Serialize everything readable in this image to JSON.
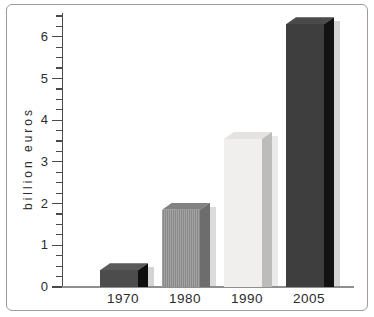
{
  "chart_data": {
    "type": "bar",
    "title": "",
    "xlabel": "",
    "ylabel": "billion euros",
    "categories": [
      "1970",
      "1980",
      "1990",
      "2005"
    ],
    "values": [
      0.4,
      1.85,
      3.55,
      6.3
    ],
    "ylim": [
      0,
      6.5
    ],
    "yticks": [
      "0",
      "1",
      "2",
      "3",
      "4",
      "5",
      "6"
    ],
    "minor_tick_step": 0.25,
    "grid": false,
    "legend": "none",
    "bar_style": "3d",
    "bars": [
      {
        "label": "1970",
        "value": 0.4,
        "front": "#4c4c4c",
        "top": "#5a5a5a",
        "side": "#0f0f0f",
        "shadow": "#d4d4d4",
        "texture": "solid"
      },
      {
        "label": "1980",
        "value": 1.85,
        "front": "#a3a3a3",
        "stripe": "#898989",
        "top": "#828282",
        "side": "#6d6d6d",
        "shadow": "#dcdcdc",
        "texture": "pinstripe"
      },
      {
        "label": "1990",
        "value": 3.55,
        "front": "#f0efed",
        "top": "#e4e3e1",
        "side": "#bcbcba",
        "shadow": "#eaeaea",
        "texture": "solid"
      },
      {
        "label": "2005",
        "value": 6.3,
        "front": "#3e3e3e",
        "top": "#4a4a4a",
        "side": "#121212",
        "shadow": "#d4d4d4",
        "texture": "solid"
      }
    ]
  },
  "colors": {
    "background": "#ffffff",
    "frame_border": "#a29a9a",
    "axis_line": "#8f8f8f",
    "tick_color": "#4a4a4a",
    "label_text": "#2b2b2b"
  }
}
